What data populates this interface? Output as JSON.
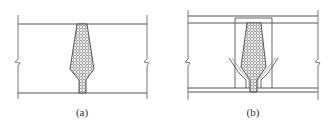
{
  "figure": {
    "panels": [
      {
        "id": "a",
        "label": "(a)",
        "description": "Wall joint with hatched tapered grout/fill section between two slab lines, break marks on both sides"
      },
      {
        "id": "b",
        "label": "(b)",
        "description": "Wall joint with double-line slabs, rectangular insert frame, hatched tapered fill section and diagonal reinforcing bars, break marks on both sides"
      }
    ],
    "colors": {
      "line": "#555555",
      "hatch": "#444444",
      "background": "#ffffff"
    }
  }
}
